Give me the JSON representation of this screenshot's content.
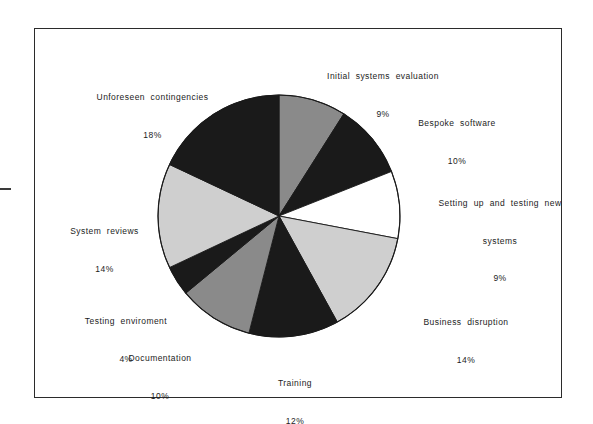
{
  "figure": {
    "background_color": "#ffffff",
    "frame_color": "#2b2b2b"
  },
  "chart_data": {
    "type": "pie",
    "title": "",
    "subtitle": "",
    "xlabel": "",
    "ylabel": "",
    "legend_position": "none",
    "grid": false,
    "start_angle_deg": 90,
    "direction": "clockwise",
    "units": "percent",
    "total": 100,
    "categories": [
      "Initial systems evaluation",
      "Bespoke software",
      "Setting up and testing new systems",
      "Business disruption",
      "Training",
      "Documentation",
      "Testing enviroment",
      "System reviews",
      "Unforeseen contingencies"
    ],
    "values": [
      9,
      10,
      9,
      14,
      12,
      10,
      4,
      14,
      18
    ],
    "colors": [
      "#8a8a8a",
      "#1a1a1a",
      "#ffffff",
      "#cfcfcf",
      "#1a1a1a",
      "#8a8a8a",
      "#1a1a1a",
      "#cfcfcf",
      "#1a1a1a"
    ],
    "slices": [
      {
        "label": "Initial systems evaluation",
        "label_lines": [
          "Initial  systems  evaluation"
        ],
        "value": 9,
        "value_label": "9%",
        "color": "#8a8a8a"
      },
      {
        "label": "Bespoke software",
        "label_lines": [
          "Bespoke  software"
        ],
        "value": 10,
        "value_label": "10%",
        "color": "#1a1a1a"
      },
      {
        "label": "Setting up and testing new systems",
        "label_lines": [
          "Setting  up  and  testing  new",
          "systems"
        ],
        "value": 9,
        "value_label": "9%",
        "color": "#ffffff"
      },
      {
        "label": "Business disruption",
        "label_lines": [
          "Business  disruption"
        ],
        "value": 14,
        "value_label": "14%",
        "color": "#cfcfcf"
      },
      {
        "label": "Training",
        "label_lines": [
          "Training"
        ],
        "value": 12,
        "value_label": "12%",
        "color": "#1a1a1a"
      },
      {
        "label": "Documentation",
        "label_lines": [
          "Documentation"
        ],
        "value": 10,
        "value_label": "10%",
        "color": "#8a8a8a"
      },
      {
        "label": "Testing enviroment",
        "label_lines": [
          "Testing  enviroment"
        ],
        "value": 4,
        "value_label": "4%",
        "color": "#1a1a1a"
      },
      {
        "label": "System reviews",
        "label_lines": [
          "System  reviews"
        ],
        "value": 14,
        "value_label": "14%",
        "color": "#cfcfcf"
      },
      {
        "label": "Unforeseen contingencies",
        "label_lines": [
          "Unforeseen  contingencies"
        ],
        "value": 18,
        "value_label": "18%",
        "color": "#1a1a1a"
      }
    ]
  },
  "labels": {
    "initial_systems_evaluation": {
      "name": "Initial  systems  evaluation",
      "pct": "9%"
    },
    "bespoke_software": {
      "name": "Bespoke  software",
      "pct": "10%"
    },
    "setting_up_testing": {
      "name_line1": "Setting  up  and  testing  new",
      "name_line2": "systems",
      "pct": "9%"
    },
    "business_disruption": {
      "name": "Business  disruption",
      "pct": "14%"
    },
    "training": {
      "name": "Training",
      "pct": "12%"
    },
    "documentation": {
      "name": "Documentation",
      "pct": "10%"
    },
    "testing_enviroment": {
      "name": "Testing  enviroment",
      "pct": "4%"
    },
    "system_reviews": {
      "name": "System  reviews",
      "pct": "14%"
    },
    "unforeseen_contingencies": {
      "name": "Unforeseen  contingencies",
      "pct": "18%"
    }
  }
}
